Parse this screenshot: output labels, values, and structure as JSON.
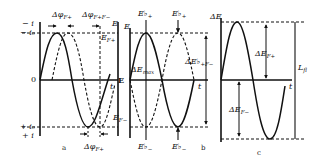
{
  "panels": {
    "a": {
      "label": "a",
      "y_top_labels": [
        "− i",
        "− i₀"
      ],
      "zero_label": "0",
      "y_bottom_labels": [
        "+ i₀",
        "+ i"
      ],
      "t_label": "t",
      "E_label": "E",
      "annotations": {
        "dphi_top": "Δφ",
        "dphi_top_sub": "F+",
        "dphi_pm": "Δφ",
        "dphi_pm_sub": "F+F−",
        "E_F_plus": "E",
        "E_F_plus_sub": "F+",
        "E_F_minus": "E",
        "E_F_minus_sub": "F−",
        "dphi_bottom": "Δφ",
        "dphi_bottom_sub": "F+"
      }
    },
    "b": {
      "label": "b",
      "y_label": "E",
      "zero_label": "E",
      "t_label": "t",
      "annotations": {
        "E_peak_1": "E♭",
        "E_peak_1_sub": "+",
        "E_peak_2": "E♭",
        "E_peak_2_sub": "+",
        "dE_max": "ΔE",
        "dE_max_sub": "max",
        "dE_pm": "ΔE♭",
        "dE_pm_sub": "+F−",
        "E_trough_1": "E♭",
        "E_trough_1_sub": "−",
        "E_trough_2": "E♭",
        "E_trough_2_sub": "−"
      }
    },
    "c": {
      "label": "c",
      "y_label": "ΔE",
      "t_label": "t",
      "annotations": {
        "dE_F_plus": "ΔE",
        "dE_F_plus_sub": "F+",
        "dE_F_minus": "ΔE",
        "dE_F_minus_sub": "F−",
        "L_fl": "L",
        "L_fl_sub": "fl"
      }
    }
  },
  "colors": {
    "ink": "#111111",
    "background": "#ffffff"
  }
}
